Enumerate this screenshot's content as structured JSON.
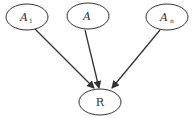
{
  "diagram": {
    "type": "directed-graph",
    "nodes": [
      {
        "id": "a1",
        "label": "A",
        "subscript": "1",
        "cx": 27,
        "cy": 17,
        "rx": 21,
        "ry": 13
      },
      {
        "id": "a",
        "label": "A",
        "subscript": "",
        "cx": 88,
        "cy": 16,
        "rx": 21,
        "ry": 13
      },
      {
        "id": "an",
        "label": "A",
        "subscript": "n",
        "cx": 167,
        "cy": 17,
        "rx": 21,
        "ry": 13
      },
      {
        "id": "r",
        "label": "R",
        "subscript": "",
        "cx": 100,
        "cy": 102,
        "rx": 21,
        "ry": 13
      }
    ],
    "edges": [
      {
        "from": "a1",
        "to": "r"
      },
      {
        "from": "a",
        "to": "r"
      },
      {
        "from": "an",
        "to": "r"
      }
    ],
    "colors": {
      "stroke": "#333333",
      "background": "#ffffff"
    }
  }
}
